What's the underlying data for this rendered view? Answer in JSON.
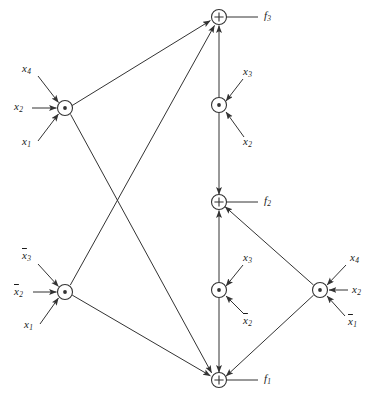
{
  "figure": {
    "background_color": "#ffffff",
    "line_color": "#333333",
    "text_color": "#1a1a1a"
  },
  "nodes": [
    {
      "id": "n_f3",
      "type": "plus",
      "symbol": "+",
      "x": 219,
      "y": 17,
      "r": 7.5,
      "output_label": "f",
      "output_sub": "3"
    },
    {
      "id": "n_and_tl",
      "type": "dot",
      "symbol": "·",
      "x": 65,
      "y": 108,
      "r": 7.5
    },
    {
      "id": "n_and_tm",
      "type": "dot",
      "symbol": "·",
      "x": 219,
      "y": 105,
      "r": 7.5
    },
    {
      "id": "n_f2",
      "type": "plus",
      "symbol": "+",
      "x": 219,
      "y": 202,
      "r": 7.5,
      "output_label": "f",
      "output_sub": "2"
    },
    {
      "id": "n_and_bl",
      "type": "dot",
      "symbol": "·",
      "x": 65,
      "y": 292,
      "r": 7.5
    },
    {
      "id": "n_and_bm",
      "type": "dot",
      "symbol": "·",
      "x": 219,
      "y": 290,
      "r": 7.5
    },
    {
      "id": "n_and_br",
      "type": "dot",
      "symbol": "·",
      "x": 320,
      "y": 290,
      "r": 7.5
    },
    {
      "id": "n_f1",
      "type": "plus",
      "symbol": "+",
      "x": 219,
      "y": 380,
      "r": 7.5,
      "output_label": "f",
      "output_sub": "1"
    }
  ],
  "outputs": [
    {
      "id": "out_f3",
      "label": "f",
      "sub": "3",
      "x": 264,
      "y": 12
    },
    {
      "id": "out_f2",
      "label": "f",
      "sub": "2",
      "x": 264,
      "y": 197
    },
    {
      "id": "out_f1",
      "label": "f",
      "sub": "1",
      "x": 264,
      "y": 375
    }
  ],
  "inputs": [
    {
      "id": "in_tl_x4",
      "base": "x",
      "sub": "4",
      "bar": false,
      "x": 22,
      "y": 68,
      "target": "n_and_tl"
    },
    {
      "id": "in_tl_x2",
      "base": "x",
      "sub": "2",
      "bar": false,
      "x": 16,
      "y": 102,
      "target": "n_and_tl"
    },
    {
      "id": "in_tl_x1",
      "base": "x",
      "sub": "1",
      "bar": false,
      "x": 22,
      "y": 138,
      "target": "n_and_tl"
    },
    {
      "id": "in_tm_x3",
      "base": "x",
      "sub": "3",
      "bar": false,
      "x": 243,
      "y": 71,
      "target": "n_and_tm"
    },
    {
      "id": "in_tm_x2",
      "base": "x",
      "sub": "2",
      "bar": false,
      "x": 243,
      "y": 138,
      "target": "n_and_tm"
    },
    {
      "id": "in_bl_x3b",
      "base": "x",
      "sub": "3",
      "bar": true,
      "x": 22,
      "y": 255,
      "target": "n_and_bl"
    },
    {
      "id": "in_bl_x2b",
      "base": "x",
      "sub": "2",
      "bar": true,
      "x": 16,
      "y": 286,
      "target": "n_and_bl"
    },
    {
      "id": "in_bl_x1",
      "base": "x",
      "sub": "1",
      "bar": false,
      "x": 24,
      "y": 321,
      "target": "n_and_bl"
    },
    {
      "id": "in_bm_x3",
      "base": "x",
      "sub": "3",
      "bar": false,
      "x": 243,
      "y": 257,
      "target": "n_and_bm"
    },
    {
      "id": "in_bm_x2b",
      "base": "x",
      "sub": "2",
      "bar": true,
      "x": 243,
      "y": 316,
      "target": "n_and_bm"
    },
    {
      "id": "in_br_x4",
      "base": "x",
      "sub": "4",
      "bar": false,
      "x": 350,
      "y": 257,
      "target": "n_and_br"
    },
    {
      "id": "in_br_x2",
      "base": "x",
      "sub": "2",
      "bar": false,
      "x": 352,
      "y": 285,
      "target": "n_and_br"
    },
    {
      "id": "in_br_x1b",
      "base": "x",
      "sub": "1",
      "bar": true,
      "x": 348,
      "y": 317,
      "target": "n_and_br"
    }
  ],
  "edges": [
    {
      "from": "n_and_tl",
      "to": "n_f3"
    },
    {
      "from": "n_and_tl",
      "to": "n_f1"
    },
    {
      "from": "n_and_bl",
      "to": "n_f3"
    },
    {
      "from": "n_and_bl",
      "to": "n_f1"
    },
    {
      "from": "n_and_tm",
      "to": "n_f3"
    },
    {
      "from": "n_and_tm",
      "to": "n_f2"
    },
    {
      "from": "n_and_bm",
      "to": "n_f2"
    },
    {
      "from": "n_and_bm",
      "to": "n_f1"
    },
    {
      "from": "n_and_br",
      "to": "n_f2"
    },
    {
      "from": "n_and_br",
      "to": "n_f1"
    }
  ]
}
